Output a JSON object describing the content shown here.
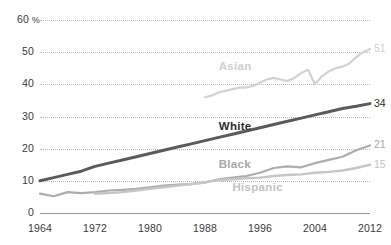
{
  "chart_data": {
    "type": "line",
    "title": "",
    "subtitle": "",
    "xlabel": "",
    "ylabel": "",
    "xlim": [
      1964,
      2012
    ],
    "ylim": [
      0,
      60
    ],
    "y_ticks": [
      0,
      10,
      20,
      30,
      40,
      50,
      60
    ],
    "y_tick_labels": [
      "0",
      "10",
      "20",
      "30",
      "40",
      "50",
      "60"
    ],
    "y_axis_unit": "%",
    "y_top_label": "60 %",
    "x_ticks": [
      1964,
      1972,
      1980,
      1988,
      1996,
      2004,
      2012
    ],
    "x_tick_labels": [
      "1964",
      "1972",
      "1980",
      "1988",
      "1996",
      "2004",
      "2012"
    ],
    "grid": "horizontal-dotted",
    "legend": "inline-series-labels",
    "series": [
      {
        "name": "Asian",
        "color": "#d2d2d2",
        "label_color": "#cfcfcf",
        "end_value": 51,
        "end_label": "51",
        "label_x_year": 1990,
        "label_y_value": 45,
        "x": [
          1988,
          1989,
          1990,
          1991,
          1992,
          1993,
          1994,
          1995,
          1996,
          1997,
          1998,
          1999,
          2000,
          2001,
          2002,
          2003,
          2004,
          2005,
          2006,
          2007,
          2008,
          2009,
          2010,
          2011,
          2012
        ],
        "values": [
          36,
          36.5,
          37.5,
          38,
          38.5,
          39,
          39,
          39.5,
          40.5,
          41.5,
          42,
          41.5,
          41,
          42,
          43.5,
          44.5,
          40,
          42.5,
          44,
          45,
          45.5,
          46.5,
          48.5,
          50,
          51
        ]
      },
      {
        "name": "White",
        "color": "#5a5a5a",
        "label_color": "#2f2f2f",
        "end_value": 34,
        "end_label": "34",
        "label_x_year": 1990,
        "label_y_value": 26.5,
        "x": [
          1964,
          1966,
          1968,
          1970,
          1972,
          1974,
          1976,
          1978,
          1980,
          1982,
          1984,
          1986,
          1988,
          1990,
          1992,
          1994,
          1996,
          1998,
          2000,
          2002,
          2004,
          2006,
          2008,
          2010,
          2012
        ],
        "values": [
          10,
          11,
          12,
          13,
          14.5,
          15.5,
          16.5,
          17.5,
          18.5,
          19.5,
          20.5,
          21.5,
          22.5,
          23.5,
          24.5,
          25.5,
          26.5,
          27.5,
          28.5,
          29.5,
          30.5,
          31.5,
          32.5,
          33.2,
          34
        ]
      },
      {
        "name": "Black",
        "color": "#adadad",
        "label_color": "#a8a8a8",
        "end_value": 21,
        "end_label": "21",
        "label_x_year": 1990,
        "label_y_value": 14.5,
        "x": [
          1964,
          1966,
          1968,
          1970,
          1972,
          1974,
          1976,
          1978,
          1980,
          1982,
          1984,
          1986,
          1988,
          1990,
          1992,
          1994,
          1996,
          1998,
          2000,
          2002,
          2004,
          2006,
          2008,
          2010,
          2012
        ],
        "values": [
          6,
          5.2,
          6.5,
          6.2,
          6.5,
          7,
          7.2,
          7.5,
          8,
          8.5,
          8.8,
          9,
          9.5,
          10.5,
          11,
          11.5,
          12.5,
          14,
          14.5,
          14.2,
          15.5,
          16.5,
          17.5,
          19.5,
          21
        ]
      },
      {
        "name": "Hispanic",
        "color": "#c6c6c6",
        "label_color": "#c2c2c2",
        "end_value": 15,
        "end_label": "15",
        "label_x_year": 1992,
        "label_y_value": 7.5,
        "x": [
          1972,
          1974,
          1976,
          1978,
          1980,
          1982,
          1984,
          1986,
          1988,
          1990,
          1992,
          1994,
          1996,
          1998,
          2000,
          2002,
          2004,
          2006,
          2008,
          2010,
          2012
        ],
        "values": [
          6,
          6.2,
          6.5,
          7,
          7.5,
          8,
          8.5,
          9,
          9.5,
          10.2,
          10.5,
          10.8,
          11,
          11.5,
          11.8,
          12,
          12.5,
          12.8,
          13.2,
          14,
          15
        ]
      }
    ]
  }
}
